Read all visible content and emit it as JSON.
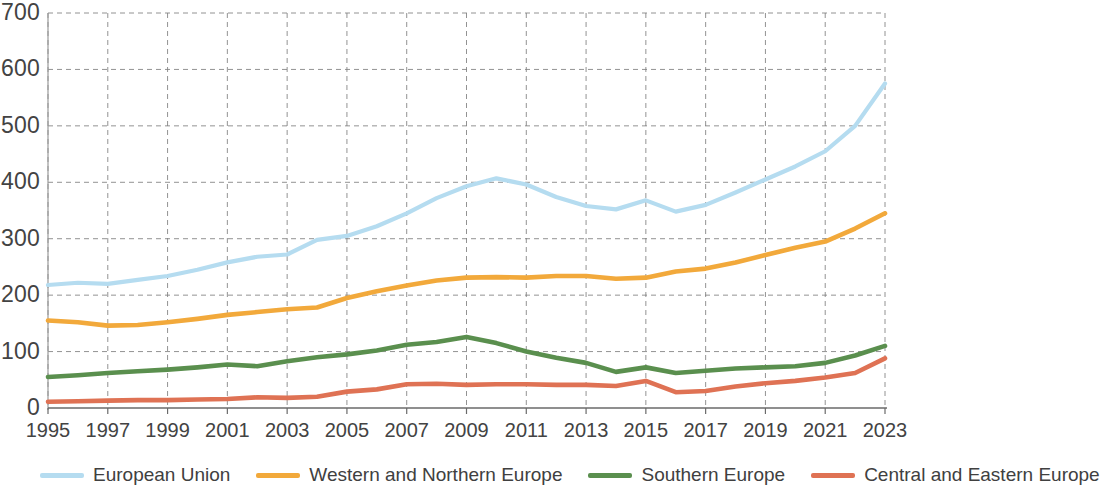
{
  "chart_data": {
    "type": "line",
    "title": "",
    "subtitle": "",
    "xlabel": "",
    "ylabel": "",
    "xlim": [
      1995,
      2023
    ],
    "ylim": [
      0,
      700
    ],
    "ytick_step": 100,
    "xtick_step": 2,
    "grid": true,
    "grid_style": "dashed",
    "legend_position": "bottom",
    "yticks": [
      "700",
      "600",
      "500",
      "400",
      "300",
      "200",
      "100",
      "0"
    ],
    "xticks": [
      "1995",
      "1997",
      "1999",
      "2001",
      "2003",
      "2005",
      "2007",
      "2009",
      "2011",
      "2013",
      "2015",
      "2017",
      "2019",
      "2021",
      "2023"
    ],
    "x": [
      1995,
      1996,
      1997,
      1998,
      1999,
      2000,
      2001,
      2002,
      2003,
      2004,
      2005,
      2006,
      2007,
      2008,
      2009,
      2010,
      2011,
      2012,
      2013,
      2014,
      2015,
      2016,
      2017,
      2018,
      2019,
      2020,
      2021,
      2022,
      2023
    ],
    "series": [
      {
        "name": "European Union",
        "color": "#b5dcf0",
        "values": [
          218,
          222,
          220,
          227,
          234,
          245,
          258,
          268,
          272,
          298,
          305,
          322,
          345,
          372,
          393,
          407,
          396,
          374,
          358,
          352,
          368,
          348,
          360,
          382,
          405,
          428,
          455,
          500,
          575
        ]
      },
      {
        "name": "Western and Northern Europe",
        "color": "#f2a93b",
        "values": [
          155,
          152,
          146,
          147,
          152,
          158,
          165,
          170,
          175,
          178,
          195,
          207,
          217,
          226,
          231,
          232,
          231,
          234,
          234,
          229,
          231,
          242,
          247,
          258,
          271,
          284,
          295,
          318,
          345
        ]
      },
      {
        "name": "Southern Europe",
        "color": "#5a8f4e",
        "values": [
          55,
          58,
          62,
          65,
          68,
          72,
          77,
          74,
          83,
          90,
          95,
          102,
          112,
          117,
          126,
          115,
          100,
          89,
          80,
          64,
          72,
          62,
          66,
          70,
          72,
          74,
          80,
          93,
          110
        ]
      },
      {
        "name": "Central and Eastern Europe",
        "color": "#df7254",
        "values": [
          11,
          12,
          13,
          14,
          14,
          15,
          16,
          19,
          18,
          20,
          29,
          33,
          42,
          43,
          41,
          42,
          42,
          41,
          41,
          39,
          48,
          28,
          30,
          38,
          44,
          48,
          54,
          62,
          88
        ]
      }
    ]
  },
  "legend": {
    "items": [
      {
        "label": "European Union",
        "color": "#b5dcf0"
      },
      {
        "label": "Western and Northern Europe",
        "color": "#f2a93b"
      },
      {
        "label": "Southern Europe",
        "color": "#5a8f4e"
      },
      {
        "label": "Central and Eastern Europe",
        "color": "#df7254"
      }
    ]
  },
  "axes": {
    "grid_color": "#808080",
    "frame_color": "#9a9a9a"
  }
}
